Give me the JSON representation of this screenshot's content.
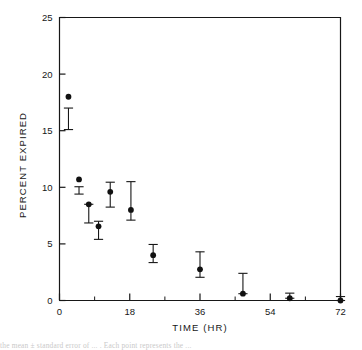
{
  "figure": {
    "name": "percent-expired-vs-time-scatter",
    "background_color": "#ffffff",
    "ink_color": "#171717"
  },
  "caption": {
    "partial_text": "the mean ± standard error of ... . Each point represents the ..."
  },
  "chart_data": {
    "type": "scatter",
    "title": "",
    "subtitle": "",
    "xlabel": "TIME (HR)",
    "ylabel": "PERCENT EXPIRED",
    "xlim": [
      0,
      72
    ],
    "ylim": [
      0,
      25
    ],
    "xticks": [
      0,
      18,
      36,
      54,
      72
    ],
    "xtick_labels": [
      "0",
      "18",
      "36",
      "54",
      "72"
    ],
    "xminorticks": [
      9,
      27,
      45,
      63
    ],
    "yticks": [
      0,
      5,
      10,
      15,
      20,
      25
    ],
    "ytick_labels": [
      "0",
      "5",
      "10",
      "15",
      "20",
      "25"
    ],
    "grid": false,
    "legend": null,
    "marker": "filled-circle",
    "marker_color": "#111111",
    "errorbar_style": "capped-vertical",
    "x": [
      2.3,
      5.0,
      7.5,
      10.0,
      13.0,
      18.3,
      24.0,
      36.0,
      47.0,
      59.0,
      72.0
    ],
    "y": [
      18.0,
      10.7,
      8.5,
      6.55,
      9.6,
      8.0,
      4.0,
      2.75,
      0.6,
      0.2,
      0.0
    ],
    "yerr_low": [
      15.1,
      9.4,
      6.85,
      5.4,
      8.25,
      7.1,
      3.35,
      2.05,
      0.6,
      0.2,
      0.0
    ],
    "yerr_high": [
      17.0,
      10.05,
      8.5,
      7.0,
      10.45,
      10.5,
      4.95,
      4.3,
      2.4,
      0.65,
      0.35
    ],
    "series": [
      {
        "name": "percent expired",
        "points": [
          {
            "x": 2.3,
            "y": 18.0,
            "lo": 15.1,
            "hi": 17.0
          },
          {
            "x": 5.0,
            "y": 10.7,
            "lo": 9.4,
            "hi": 10.05
          },
          {
            "x": 7.5,
            "y": 8.5,
            "lo": 6.85,
            "hi": 8.5
          },
          {
            "x": 10.0,
            "y": 6.55,
            "lo": 5.4,
            "hi": 7.0
          },
          {
            "x": 13.0,
            "y": 9.6,
            "lo": 8.25,
            "hi": 10.45
          },
          {
            "x": 18.3,
            "y": 8.0,
            "lo": 7.1,
            "hi": 10.5
          },
          {
            "x": 24.0,
            "y": 4.0,
            "lo": 3.35,
            "hi": 4.95
          },
          {
            "x": 36.0,
            "y": 2.75,
            "lo": 2.05,
            "hi": 4.3
          },
          {
            "x": 47.0,
            "y": 0.6,
            "lo": 0.6,
            "hi": 2.4
          },
          {
            "x": 59.0,
            "y": 0.2,
            "lo": 0.2,
            "hi": 0.65
          },
          {
            "x": 72.0,
            "y": 0.0,
            "lo": 0.0,
            "hi": 0.35
          }
        ]
      }
    ]
  }
}
